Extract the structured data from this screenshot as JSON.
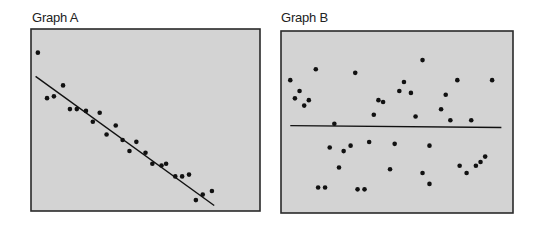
{
  "chart_data": [
    {
      "type": "scatter",
      "title": "Graph A",
      "xlabel": "",
      "ylabel": "",
      "xlim": [
        0,
        100
      ],
      "ylim": [
        0,
        100
      ],
      "grid": false,
      "background_color": "#d3d3d3",
      "point_color": "#111111",
      "line_color": "#111111",
      "trend_line": {
        "x": [
          2,
          80
        ],
        "y": [
          74,
          3
        ]
      },
      "points": [
        [
          3,
          87
        ],
        [
          7,
          62
        ],
        [
          10,
          63
        ],
        [
          14,
          69
        ],
        [
          17,
          56
        ],
        [
          20,
          56
        ],
        [
          24,
          55
        ],
        [
          27,
          49
        ],
        [
          30,
          54
        ],
        [
          33,
          42
        ],
        [
          37,
          47
        ],
        [
          40,
          39
        ],
        [
          43,
          33
        ],
        [
          46,
          38
        ],
        [
          50,
          32
        ],
        [
          53,
          26
        ],
        [
          57,
          25
        ],
        [
          59,
          26
        ],
        [
          63,
          19
        ],
        [
          66,
          19
        ],
        [
          69,
          20
        ],
        [
          72,
          6
        ],
        [
          75,
          9
        ],
        [
          79,
          11
        ]
      ]
    },
    {
      "type": "scatter",
      "title": "Graph B",
      "xlabel": "",
      "ylabel": "",
      "xlim": [
        0,
        100
      ],
      "ylim": [
        0,
        100
      ],
      "grid": false,
      "background_color": "#d3d3d3",
      "point_color": "#111111",
      "line_color": "#111111",
      "trend_line": {
        "x": [
          4,
          95
        ],
        "y": [
          48,
          47
        ]
      },
      "points": [
        [
          4,
          73
        ],
        [
          6,
          63
        ],
        [
          8,
          67
        ],
        [
          10,
          59
        ],
        [
          12,
          62
        ],
        [
          15,
          79
        ],
        [
          23,
          49
        ],
        [
          32,
          77
        ],
        [
          40,
          54
        ],
        [
          42,
          62
        ],
        [
          44,
          61
        ],
        [
          51,
          67
        ],
        [
          53,
          72
        ],
        [
          56,
          66
        ],
        [
          58,
          53
        ],
        [
          61,
          84
        ],
        [
          69,
          57
        ],
        [
          71,
          65
        ],
        [
          73,
          51
        ],
        [
          76,
          73
        ],
        [
          82,
          51
        ],
        [
          91,
          73
        ],
        [
          21,
          36
        ],
        [
          25,
          25
        ],
        [
          27,
          34
        ],
        [
          30,
          37
        ],
        [
          38,
          39
        ],
        [
          47,
          24
        ],
        [
          49,
          38
        ],
        [
          61,
          22
        ],
        [
          64,
          16
        ],
        [
          64,
          37
        ],
        [
          77,
          26
        ],
        [
          80,
          22
        ],
        [
          84,
          26
        ],
        [
          86,
          28
        ],
        [
          88,
          31
        ],
        [
          16,
          14
        ],
        [
          19,
          14
        ],
        [
          33,
          13
        ],
        [
          36,
          13
        ]
      ]
    }
  ]
}
